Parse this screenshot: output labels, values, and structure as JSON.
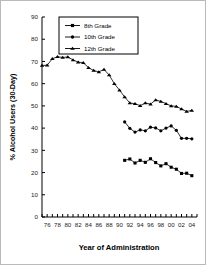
{
  "chart_data": {
    "type": "line",
    "title": "",
    "xlabel": "Year of Administration",
    "ylabel": "% Alcohol Users (30-Day)",
    "xlim": [
      1975.0,
      2005.0
    ],
    "ylim": [
      0,
      90
    ],
    "ytick_step": 10,
    "yticks": [
      0,
      10,
      20,
      30,
      40,
      50,
      60,
      70,
      80,
      90
    ],
    "ytick_labels": [
      "0",
      "10",
      "20",
      "30",
      "40",
      "50",
      "60",
      "70",
      "80",
      "90"
    ],
    "xticks": [
      1976,
      1978,
      1980,
      1982,
      1984,
      1986,
      1988,
      1990,
      1992,
      1994,
      1996,
      1998,
      2000,
      2002,
      2004
    ],
    "xtick_labels": [
      "76",
      "78",
      "80",
      "82",
      "84",
      "86",
      "88",
      "90",
      "92",
      "94",
      "96",
      "98",
      "00",
      "02",
      "04"
    ],
    "x_minor_ticks": [
      1975,
      1976,
      1977,
      1978,
      1979,
      1980,
      1981,
      1982,
      1983,
      1984,
      1985,
      1986,
      1987,
      1988,
      1989,
      1990,
      1991,
      1992,
      1993,
      1994,
      1995,
      1996,
      1997,
      1998,
      1999,
      2000,
      2001,
      2002,
      2003,
      2004,
      2005
    ],
    "grid": false,
    "legend_position": "top-center",
    "series": [
      {
        "name": "8th Grade",
        "marker": "square",
        "x": [
          1991,
          1992,
          1993,
          1994,
          1995,
          1996,
          1997,
          1998,
          1999,
          2000,
          2001,
          2002,
          2003,
          2004
        ],
        "values": [
          25.5,
          26.1,
          24.3,
          25.5,
          24.6,
          26.2,
          24.5,
          23.0,
          24.0,
          22.4,
          21.5,
          19.6,
          19.7,
          18.6
        ]
      },
      {
        "name": "10th Grade",
        "marker": "circle",
        "x": [
          1991,
          1992,
          1993,
          1994,
          1995,
          1996,
          1997,
          1998,
          1999,
          2000,
          2001,
          2002,
          2003,
          2004
        ],
        "values": [
          42.8,
          39.9,
          38.2,
          39.2,
          38.8,
          40.4,
          40.1,
          38.8,
          40.0,
          41.0,
          39.0,
          35.4,
          35.4,
          35.2
        ]
      },
      {
        "name": "12th Grade",
        "marker": "triangle",
        "x": [
          1975,
          1976,
          1977,
          1978,
          1979,
          1980,
          1981,
          1982,
          1983,
          1984,
          1985,
          1986,
          1987,
          1988,
          1989,
          1990,
          1991,
          1992,
          1993,
          1994,
          1995,
          1996,
          1997,
          1998,
          1999,
          2000,
          2001,
          2002,
          2003,
          2004
        ],
        "values": [
          68.2,
          68.3,
          71.2,
          72.1,
          71.8,
          72.0,
          70.7,
          69.7,
          69.4,
          67.2,
          65.9,
          65.3,
          66.4,
          63.9,
          60.0,
          57.1,
          54.0,
          51.3,
          51.0,
          50.1,
          51.3,
          50.8,
          52.7,
          52.0,
          51.0,
          50.0,
          49.8,
          48.6,
          47.5,
          48.0
        ]
      }
    ],
    "legend": [
      "8th Grade",
      "10th Grade",
      "12th Grade"
    ],
    "colors": {
      "series": "#000000",
      "axis": "#000000",
      "background": "#ffffff",
      "border": "#b9b9b9"
    }
  }
}
